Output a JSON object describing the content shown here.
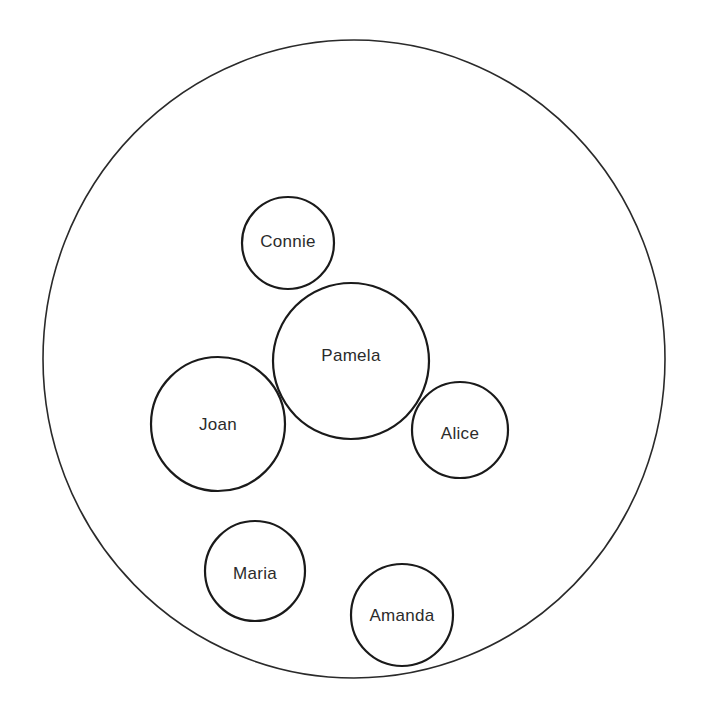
{
  "diagram": {
    "type": "circle-diagram",
    "outer": {
      "cx": 354,
      "cy": 359,
      "rx": 311,
      "ry": 319
    },
    "people": [
      {
        "name": "Connie",
        "cx": 288,
        "cy": 243,
        "r": 46,
        "label_dy": -2
      },
      {
        "name": "Pamela",
        "cx": 351,
        "cy": 361,
        "r": 78,
        "label_dy": -6
      },
      {
        "name": "Joan",
        "cx": 218,
        "cy": 424,
        "r": 67,
        "label_dy": 0
      },
      {
        "name": "Alice",
        "cx": 460,
        "cy": 430,
        "r": 48,
        "label_dy": 3
      },
      {
        "name": "Maria",
        "cx": 255,
        "cy": 571,
        "r": 50,
        "label_dy": 2
      },
      {
        "name": "Amanda",
        "cx": 402,
        "cy": 615,
        "r": 51,
        "label_dy": 0
      }
    ],
    "colors": {
      "stroke": "#1a1a1a",
      "text": "#2b2b2b",
      "background": "#ffffff"
    }
  }
}
